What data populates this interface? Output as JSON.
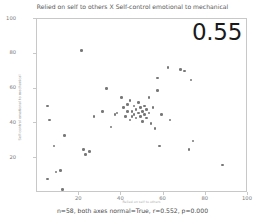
{
  "chart_data": {
    "type": "scatter",
    "title": "Relied on self to others X Self-control emotional to mechanical",
    "xlabel": "Relied on self to others",
    "ylabel": "Self-control emotional to mechanical",
    "xlim": [
      0,
      100
    ],
    "ylim": [
      0,
      100
    ],
    "grid": false,
    "legend": null,
    "xticks": [
      20,
      40,
      60,
      80,
      100
    ],
    "yticks": [
      20,
      40,
      60,
      80,
      100
    ],
    "annotation": "0.55",
    "caption": "n=58, both axes normal=True, r=0.552, p=0.000",
    "n": 58,
    "r": 0.552,
    "p": 0.0,
    "marker_color": "#595959",
    "frame_color": "#c8c8c8",
    "points": [
      {
        "x": 5,
        "y": 50
      },
      {
        "x": 5,
        "y": 8
      },
      {
        "x": 6,
        "y": 42
      },
      {
        "x": 8,
        "y": 27
      },
      {
        "x": 9,
        "y": 12
      },
      {
        "x": 11,
        "y": 13
      },
      {
        "x": 12,
        "y": 2
      },
      {
        "x": 13,
        "y": 33
      },
      {
        "x": 21,
        "y": 82
      },
      {
        "x": 22,
        "y": 25
      },
      {
        "x": 23,
        "y": 22
      },
      {
        "x": 25,
        "y": 24
      },
      {
        "x": 27,
        "y": 44
      },
      {
        "x": 31,
        "y": 47
      },
      {
        "x": 33,
        "y": 60
      },
      {
        "x": 35,
        "y": 38
      },
      {
        "x": 37,
        "y": 45
      },
      {
        "x": 38,
        "y": 46
      },
      {
        "x": 40,
        "y": 55
      },
      {
        "x": 41,
        "y": 49
      },
      {
        "x": 42,
        "y": 44
      },
      {
        "x": 43,
        "y": 51
      },
      {
        "x": 43,
        "y": 47
      },
      {
        "x": 44,
        "y": 42
      },
      {
        "x": 44,
        "y": 53
      },
      {
        "x": 45,
        "y": 47
      },
      {
        "x": 45,
        "y": 44
      },
      {
        "x": 46,
        "y": 50
      },
      {
        "x": 46,
        "y": 45
      },
      {
        "x": 47,
        "y": 48
      },
      {
        "x": 47,
        "y": 43
      },
      {
        "x": 48,
        "y": 52
      },
      {
        "x": 48,
        "y": 46
      },
      {
        "x": 49,
        "y": 44
      },
      {
        "x": 49,
        "y": 49
      },
      {
        "x": 50,
        "y": 47
      },
      {
        "x": 50,
        "y": 41
      },
      {
        "x": 51,
        "y": 45
      },
      {
        "x": 51,
        "y": 50
      },
      {
        "x": 52,
        "y": 48
      },
      {
        "x": 52,
        "y": 43
      },
      {
        "x": 53,
        "y": 55
      },
      {
        "x": 53,
        "y": 46
      },
      {
        "x": 54,
        "y": 40
      },
      {
        "x": 55,
        "y": 49
      },
      {
        "x": 56,
        "y": 37
      },
      {
        "x": 57,
        "y": 66
      },
      {
        "x": 57,
        "y": 59
      },
      {
        "x": 58,
        "y": 27
      },
      {
        "x": 59,
        "y": 45
      },
      {
        "x": 62,
        "y": 72
      },
      {
        "x": 63,
        "y": 42
      },
      {
        "x": 68,
        "y": 71
      },
      {
        "x": 70,
        "y": 70
      },
      {
        "x": 72,
        "y": 25
      },
      {
        "x": 73,
        "y": 65
      },
      {
        "x": 74,
        "y": 30
      },
      {
        "x": 88,
        "y": 16
      }
    ]
  }
}
